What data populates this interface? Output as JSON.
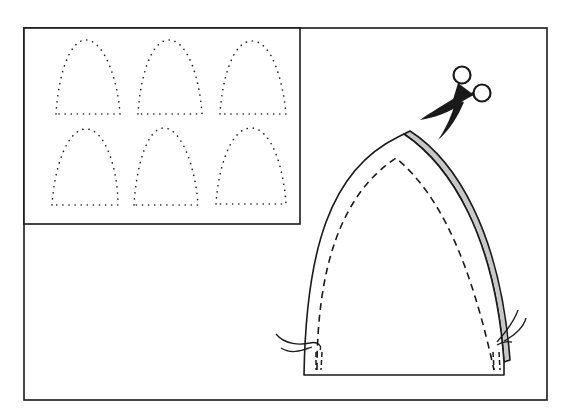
{
  "illustration": {
    "description": "Craft instruction illustration: a sheet of six dotted arch templates, and one arch-shaped fabric piece with dashed seam lines, a shaded folded edge, loose threads at the base, and scissors cutting along the edge",
    "colors": {
      "ink": "#1a1a1a",
      "paper": "#ffffff",
      "fold_shade": "#c8c8c8"
    },
    "template_sheet": {
      "rows": 2,
      "columns": 3,
      "template_count": 6,
      "outline_style": "dotted"
    },
    "cut_piece": {
      "shape": "arch",
      "seam_style": "dashed",
      "folded_edge": "right",
      "threads": [
        "left-base",
        "right-base"
      ]
    },
    "tool": {
      "name": "scissors",
      "icon": "scissors-icon"
    }
  }
}
